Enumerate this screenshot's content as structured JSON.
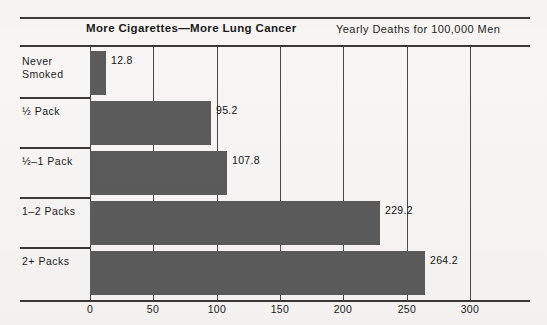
{
  "header": {
    "title": "More Cigarettes—More Lung Cancer",
    "subtitle": "Yearly Deaths for 100,000 Men"
  },
  "chart_data": {
    "type": "bar",
    "orientation": "horizontal",
    "title": "More Cigarettes—More Lung Cancer",
    "subtitle": "Yearly Deaths for 100,000 Men",
    "xlabel": "",
    "ylabel": "",
    "xlim": [
      0,
      300
    ],
    "xticks": [
      0,
      50,
      100,
      150,
      200,
      250,
      300
    ],
    "xtick_labels": [
      "0",
      "50",
      "100",
      "150",
      "200",
      "250",
      "300"
    ],
    "grid": "vertical",
    "legend": "none",
    "bar_color": "#5b5b5b",
    "background_color": "#f7f6f4",
    "rule_color": "#3a3a3a",
    "categories": [
      "Never\nSmoked",
      "½  Pack",
      "½–1  Pack",
      "1–2  Packs",
      "2+  Packs"
    ],
    "values": [
      12.8,
      95.2,
      107.8,
      229.2,
      264.2
    ],
    "value_labels": [
      "12.8",
      "95.2",
      "107.8",
      "229.2",
      "264.2"
    ],
    "rows": [
      {
        "label": "Never\nSmoked",
        "value": 12.8,
        "value_label": "12.8"
      },
      {
        "label": "½  Pack",
        "value": 95.2,
        "value_label": "95.2"
      },
      {
        "label": "½–1  Pack",
        "value": 107.8,
        "value_label": "107.8"
      },
      {
        "label": "1–2  Packs",
        "value": 229.2,
        "value_label": "229.2"
      },
      {
        "label": "2+  Packs",
        "value": 264.2,
        "value_label": "264.2"
      }
    ]
  }
}
